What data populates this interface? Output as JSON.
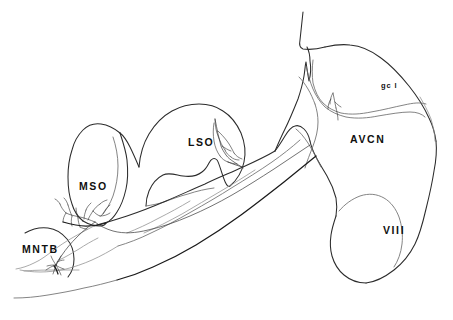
{
  "figure": {
    "kind": "anatomical-line-drawing",
    "background_color": "#ffffff",
    "line_color": "#2b2b2b",
    "soft_line_color": "#6e6e6e",
    "axon_color": "#1a1a1a",
    "width": 453,
    "height": 320
  },
  "labels": {
    "mntb": "MNTB",
    "mso": "MSO",
    "lso": "LSO",
    "avcn": "AVCN",
    "viii": "VIII",
    "gcl": "gc l"
  },
  "structures": [
    {
      "id": "mntb",
      "name": "MNTB",
      "label": "MNTB",
      "kind": "nucleus-outline"
    },
    {
      "id": "mso",
      "name": "MSO",
      "label": "MSO",
      "kind": "nucleus-outline"
    },
    {
      "id": "lso",
      "name": "LSO",
      "label": "LSO",
      "kind": "nucleus-outline"
    },
    {
      "id": "avcn",
      "name": "AVCN",
      "label": "AVCN",
      "kind": "nucleus-outline"
    },
    {
      "id": "viii",
      "name": "VIII",
      "label": "VIII",
      "kind": "nerve-root-outline"
    },
    {
      "id": "gcl",
      "name": "granule cell layer",
      "label": "gc l",
      "kind": "layer-outline"
    }
  ],
  "traced_neuron": {
    "terminal_arbors": [
      {
        "id": "arbor-mntb",
        "located_in": "MNTB"
      },
      {
        "id": "arbor-mso",
        "located_in": "MSO"
      },
      {
        "id": "arbor-lso",
        "located_in": "LSO"
      },
      {
        "id": "arbor-avcn",
        "located_in": "AVCN"
      }
    ]
  }
}
